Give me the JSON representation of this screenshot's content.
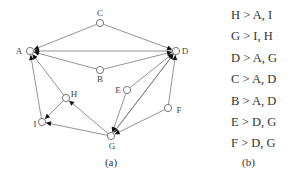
{
  "diagram": {
    "nodes": [
      {
        "id": "A",
        "label": "A",
        "x": 30,
        "y": 51,
        "lx": 19,
        "ly": 54
      },
      {
        "id": "B",
        "label": "B",
        "x": 100,
        "y": 70,
        "lx": 100,
        "ly": 82
      },
      {
        "id": "C",
        "label": "C",
        "x": 100,
        "y": 23,
        "lx": 100,
        "ly": 16
      },
      {
        "id": "D",
        "label": "D",
        "x": 176,
        "y": 51,
        "lx": 185,
        "ly": 54
      },
      {
        "id": "E",
        "label": "E",
        "x": 127,
        "y": 90,
        "lx": 118,
        "ly": 93
      },
      {
        "id": "F",
        "label": "F",
        "x": 168,
        "y": 108,
        "lx": 179,
        "ly": 113
      },
      {
        "id": "G",
        "label": "G",
        "x": 111,
        "y": 136,
        "lx": 112,
        "ly": 149
      },
      {
        "id": "H",
        "label": "H",
        "x": 66,
        "y": 98,
        "lx": 74,
        "ly": 97
      },
      {
        "id": "I",
        "label": "I",
        "x": 42,
        "y": 122,
        "lx": 35,
        "ly": 127
      }
    ],
    "edges": [
      {
        "from": "H",
        "to": "A"
      },
      {
        "from": "H",
        "to": "I"
      },
      {
        "from": "G",
        "to": "I"
      },
      {
        "from": "G",
        "to": "H"
      },
      {
        "from": "D",
        "to": "A"
      },
      {
        "from": "D",
        "to": "G"
      },
      {
        "from": "C",
        "to": "A"
      },
      {
        "from": "C",
        "to": "D"
      },
      {
        "from": "B",
        "to": "A"
      },
      {
        "from": "B",
        "to": "D"
      },
      {
        "from": "E",
        "to": "D"
      },
      {
        "from": "E",
        "to": "G"
      },
      {
        "from": "F",
        "to": "D"
      },
      {
        "from": "F",
        "to": "G"
      },
      {
        "from": "I",
        "to": "A"
      },
      {
        "from": "G",
        "to": "D"
      }
    ],
    "caption": "(a)"
  },
  "rules": {
    "items": [
      "H > A, I",
      "G > I, H",
      "D > A, G",
      "C > A, D",
      "B > A, D",
      "E > D, G",
      "F > D, G"
    ],
    "caption": "(b)"
  },
  "colors": {
    "edge": "#777777",
    "arrow": "#111111",
    "node_stroke": "#555555",
    "text": "#333333"
  }
}
